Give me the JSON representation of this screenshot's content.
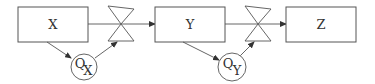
{
  "diagram": {
    "type": "process-flow",
    "colors": {
      "stroke": "#555555",
      "text": "#333333",
      "background": "#ffffff"
    },
    "nodes": [
      {
        "id": "X",
        "label": "X",
        "shape": "rectangle"
      },
      {
        "id": "Y",
        "label": "Y",
        "shape": "rectangle"
      },
      {
        "id": "Z",
        "label": "Z",
        "shape": "rectangle"
      }
    ],
    "valves": [
      {
        "id": "valve1",
        "between": [
          "X",
          "Y"
        ]
      },
      {
        "id": "valve2",
        "between": [
          "Y",
          "Z"
        ]
      }
    ],
    "controllers": [
      {
        "id": "QX",
        "letter": "Q",
        "subscript": "X",
        "senses": "X",
        "actuates": "valve1"
      },
      {
        "id": "QY",
        "letter": "Q",
        "subscript": "Y",
        "senses": "Y",
        "actuates": "valve2"
      }
    ]
  }
}
